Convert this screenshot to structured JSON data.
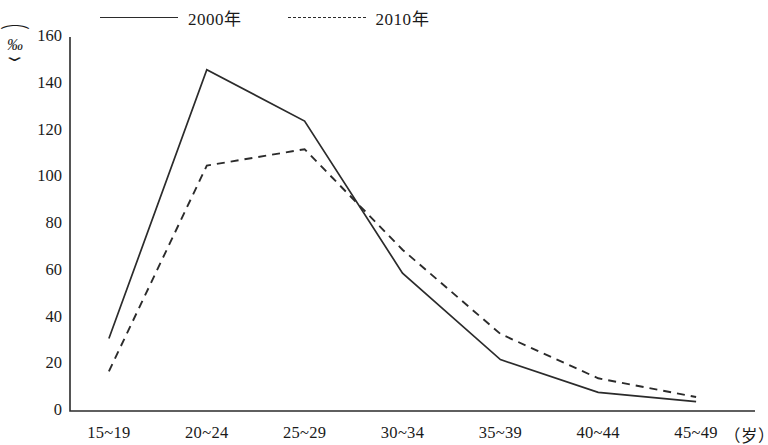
{
  "legend": {
    "entries": [
      {
        "label": "2000年",
        "style": "solid",
        "swatch_icon": "solid-line-icon"
      },
      {
        "label": "2010年",
        "style": "dashed",
        "swatch_icon": "dashed-line-icon"
      }
    ]
  },
  "axes": {
    "y_unit_open": "⌒",
    "y_unit_symbol": "‰",
    "y_unit_close": "⌄",
    "x_unit": "（岁）"
  },
  "chart_data": {
    "type": "line",
    "title": "",
    "xlabel": "（岁）",
    "ylabel": "‰",
    "categories": [
      "15~19",
      "20~24",
      "25~29",
      "30~34",
      "35~39",
      "40~44",
      "45~49"
    ],
    "yticks": [
      0,
      20,
      40,
      60,
      80,
      100,
      120,
      140,
      160
    ],
    "ylim": [
      0,
      160
    ],
    "grid": false,
    "legend_position": "top",
    "series": [
      {
        "name": "2000年",
        "style": "solid",
        "values": [
          31,
          146,
          124,
          59,
          22,
          8,
          4
        ]
      },
      {
        "name": "2010年",
        "style": "dashed",
        "values": [
          17,
          105,
          112,
          69,
          33,
          14,
          6
        ]
      }
    ]
  }
}
